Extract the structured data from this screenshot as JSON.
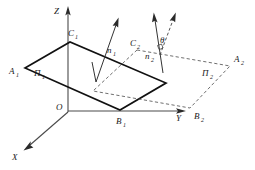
{
  "figure": {
    "background_color": "#ffffff",
    "line_color": "#111111",
    "dashed_color": "#555555",
    "axis_color": "#4a4a4a"
  },
  "axes": {
    "origin_label": "O",
    "z_label": "Z",
    "y_label": "Y",
    "x_label": "X"
  },
  "planes": {
    "plane1_label": "Π",
    "plane1_sub": "1",
    "plane2_label": "Π",
    "plane2_sub": "2"
  },
  "vertices": {
    "a1_label": "A",
    "a1_sub": "1",
    "b1_label": "B",
    "b1_sub": "1",
    "c1_label": "C",
    "c1_sub": "1",
    "a2_label": "A",
    "a2_sub": "2",
    "b2_label": "B",
    "b2_sub": "2",
    "c2_label": "C",
    "c2_sub": "2"
  },
  "normals": {
    "n1_label": "n",
    "n1_sub": "1",
    "n2_label": "n",
    "n2_sub": "2"
  },
  "angle": {
    "theta_label": "θ"
  }
}
